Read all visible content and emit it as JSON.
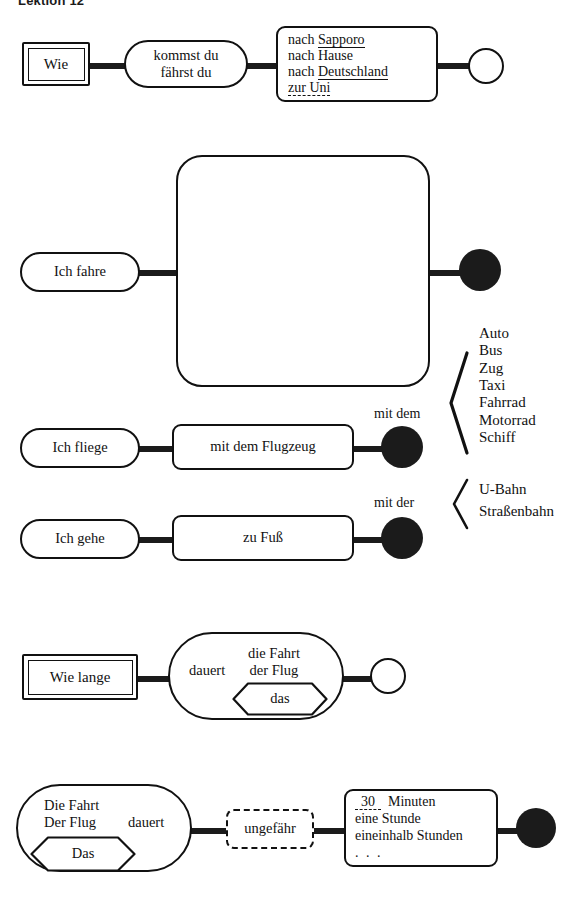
{
  "title": "Lektion 12",
  "rows": [
    {
      "id": "row-question-wie",
      "kind": "question",
      "start_label": "Wie",
      "verb_lines": [
        "kommst du",
        "fährst du"
      ],
      "options": [
        {
          "prefix": "nach ",
          "word": "Sapporo",
          "underline": "solid"
        },
        {
          "prefix": "nach ",
          "word": "Hause",
          "underline": "none"
        },
        {
          "prefix": "nach ",
          "word": "Deutschland",
          "underline": "solid"
        },
        {
          "prefix": "",
          "word": "zur Uni",
          "underline": "dashed"
        }
      ],
      "terminal": "open-circle"
    },
    {
      "id": "row-ich-fahre",
      "kind": "statement",
      "start_label": "Ich fahre",
      "groups": [
        {
          "article": "mit dem",
          "items": [
            "Auto",
            "Bus",
            "Zug",
            "Taxi",
            "Fahrrad",
            "Motorrad",
            "Schiff"
          ]
        },
        {
          "article": "mit der",
          "items": [
            "U-Bahn",
            "Straßenbahn"
          ]
        }
      ],
      "terminal": "filled-circle"
    },
    {
      "id": "row-ich-fliege",
      "kind": "statement",
      "start_label": "Ich fliege",
      "middle_label": "mit dem Flugzeug",
      "terminal": "filled-circle"
    },
    {
      "id": "row-ich-gehe",
      "kind": "statement",
      "start_label": "Ich gehe",
      "middle_label": "zu Fuß",
      "terminal": "filled-circle"
    },
    {
      "id": "row-wie-lange",
      "kind": "question",
      "start_label": "Wie lange",
      "verb_label": "dauert",
      "subject_lines": [
        "die Fahrt",
        "der Flug"
      ],
      "hexagon_label": "das",
      "terminal": "open-circle"
    },
    {
      "id": "row-dauer",
      "kind": "statement",
      "subject_lines": [
        "Die Fahrt",
        "Der Flug"
      ],
      "verb_label": "dauert",
      "hexagon_label": "Das",
      "modifier_label": "ungefähr",
      "durations": [
        {
          "blank": "30",
          "underline": "dashed",
          "rest": "Minuten"
        },
        {
          "blank": "",
          "underline": "none",
          "rest": "eine Stunde"
        },
        {
          "blank": "",
          "underline": "none",
          "rest": "eineinhalb Stunden"
        },
        {
          "blank": "",
          "underline": "none",
          "rest": ". . ."
        }
      ],
      "terminal": "filled-circle"
    }
  ],
  "colors": {
    "ink": "#111111",
    "connector": "#1b1b1b",
    "paper": "#ffffff"
  }
}
